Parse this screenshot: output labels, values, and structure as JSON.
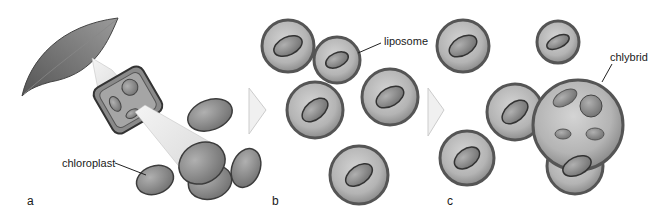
{
  "figure": {
    "panels": [
      {
        "letter": "a",
        "description": "Leaf cell disrupted releasing chloroplasts"
      },
      {
        "letter": "b",
        "description": "Chloroplasts encapsulated in liposomes"
      },
      {
        "letter": "c",
        "description": "Liposomes fused into chlybrid"
      }
    ],
    "labels": {
      "chloroplast": "chloroplast",
      "liposome": "liposome",
      "chlybrid": "chlybrid"
    },
    "colors": {
      "background": "#ffffff",
      "membrane_dark": "#5a5a5a",
      "membrane_fill": "#a8a8a8",
      "chloroplast_fill": "#8a8a8a",
      "chloroplast_stroke": "#3c3c3c",
      "arrow_fill": "#eeeeee",
      "leaf": "#6e6e6e"
    }
  }
}
